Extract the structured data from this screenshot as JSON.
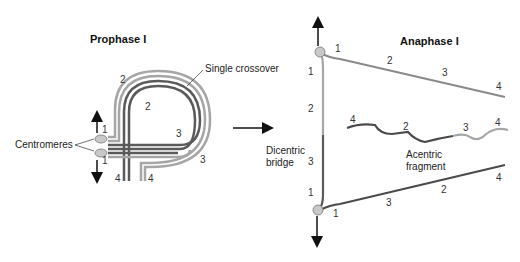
{
  "prophase": {
    "title": "Prophase I",
    "crossover_label": "Single crossover",
    "centromeres_label": "Centromeres",
    "numbers": {
      "top_outer_2": "2",
      "inner_2": "2",
      "inner_3": "3",
      "outer_3": "3",
      "top_1": "1",
      "bottom_1": "1",
      "left_4": "4",
      "right_4": "4"
    }
  },
  "arrow": {
    "direction": "right"
  },
  "anaphase": {
    "title": "Anaphase I",
    "dicentric_label_line1": "Dicentric",
    "dicentric_label_line2": "bridge",
    "acentric_label_line1": "Acentric",
    "acentric_label_line2": "fragment",
    "top_arm": [
      "1",
      "2",
      "3",
      "4"
    ],
    "bridge": [
      "1",
      "2",
      "3",
      "1"
    ],
    "fragment": [
      "4",
      "2",
      "3",
      "4"
    ],
    "bottom_arm": [
      "1",
      "3",
      "2",
      "4"
    ]
  },
  "colors": {
    "light_chromatid": "#a6a6a6",
    "dark_chromatid": "#5a5a5a",
    "centromere": "#c8c8c8",
    "text": "#222222"
  }
}
